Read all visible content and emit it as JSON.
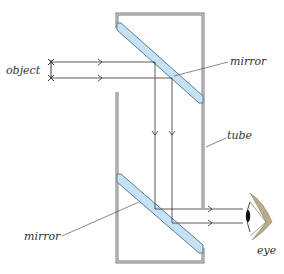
{
  "diagram": {
    "labels": {
      "object": "object",
      "mirror_top": "mirror",
      "mirror_bottom": "mirror",
      "tube": "tube",
      "eye": "eye"
    },
    "colors": {
      "tube_wall": "#7a7a7a",
      "tube_wall_inner": "#d8d8d8",
      "mirror_fill": "#c6e0f4",
      "mirror_edge": "#5a7d96",
      "ray": "#333333",
      "eye_lid": "#b8ad8a",
      "pupil": "#111111"
    }
  }
}
